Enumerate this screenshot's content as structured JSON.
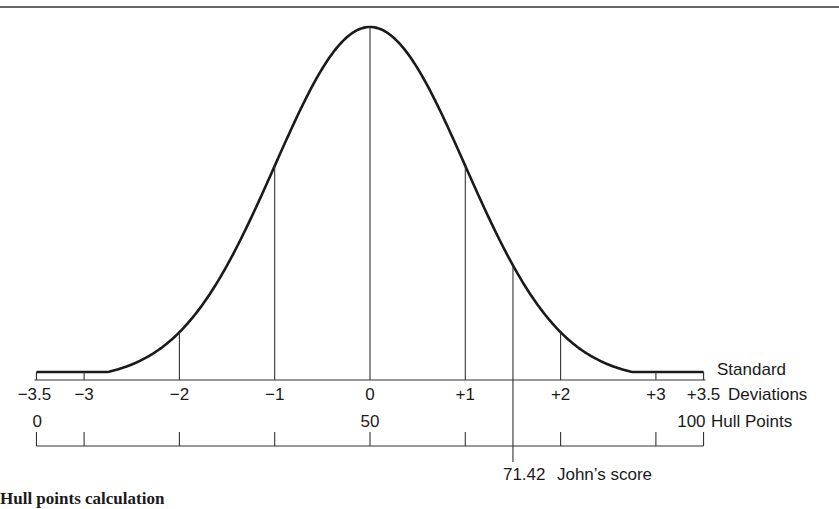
{
  "figure": {
    "caption": "Hull points calculation",
    "sd_axis": {
      "title_line1": "Standard",
      "title_line2": "Deviations",
      "ticks": [
        {
          "value": -3.5,
          "label": "−3.5"
        },
        {
          "value": -3,
          "label": "−3"
        },
        {
          "value": -2,
          "label": "−2"
        },
        {
          "value": -1,
          "label": "−1"
        },
        {
          "value": 0,
          "label": "0"
        },
        {
          "value": 1,
          "label": "+1"
        },
        {
          "value": 2,
          "label": "+2"
        },
        {
          "value": 3,
          "label": "+3"
        },
        {
          "value": 3.5,
          "label": "+3.5"
        }
      ]
    },
    "hull_axis": {
      "title": "Hull Points",
      "labels": [
        {
          "value": 0,
          "label": "0"
        },
        {
          "value": 50,
          "label": "50"
        },
        {
          "value": 100,
          "label": "100"
        }
      ]
    },
    "marker": {
      "sd": 1.5,
      "hull_value": "71.42",
      "label": "John’s score"
    }
  },
  "chart_data": {
    "type": "line",
    "xlabel": "Standard Deviations",
    "x2label": "Hull Points",
    "xlim": [
      -3.5,
      3.5
    ],
    "x2lim": [
      0,
      100
    ],
    "curve": "standard normal density (bell curve)",
    "vertical_lines_at_sd": [
      -3,
      -2,
      -1,
      0,
      1,
      1.5,
      2,
      3
    ],
    "sd_tick_labels": [
      "−3.5",
      "−3",
      "−2",
      "−1",
      "0",
      "+1",
      "+2",
      "+3",
      "+3.5"
    ],
    "hull_tick_labels": [
      "0",
      "50",
      "100"
    ],
    "hull_ticks_at_sd": [
      -3.5,
      -3,
      -2,
      -1,
      0,
      1,
      2,
      3,
      3.5
    ],
    "annotations": [
      {
        "x_sd": 1.5,
        "hull": 71.42,
        "text": "John’s score"
      }
    ],
    "grid": false,
    "legend": null
  },
  "layout": {
    "x0": 370,
    "sd_px": 95.3,
    "axis_y": 380,
    "peak_y": 27,
    "hull_axis_y": 446,
    "hull_tick_top": 432
  }
}
